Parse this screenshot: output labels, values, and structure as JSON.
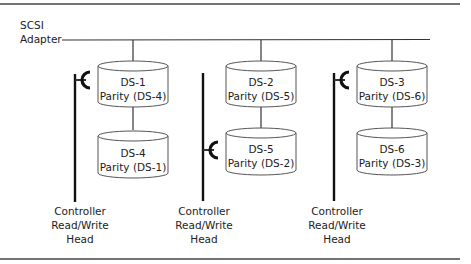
{
  "adapter": {
    "line1": "SCSI",
    "line2": "Adapter"
  },
  "disks": [
    {
      "id": "DS-1",
      "name": "DS-1",
      "parity": "Parity (DS-4)"
    },
    {
      "id": "DS-4",
      "name": "DS-4",
      "parity": "Parity (DS-1)"
    },
    {
      "id": "DS-2",
      "name": "DS-2",
      "parity": "Parity (DS-5)"
    },
    {
      "id": "DS-5",
      "name": "DS-5",
      "parity": "Parity (DS-2)"
    },
    {
      "id": "DS-3",
      "name": "DS-3",
      "parity": "Parity (DS-6)"
    },
    {
      "id": "DS-6",
      "name": "DS-6",
      "parity": "Parity (DS-3)"
    }
  ],
  "heads": [
    {
      "line1": "Controller",
      "line2": "Read/Write",
      "line3": "Head"
    },
    {
      "line1": "Controller",
      "line2": "Read/Write",
      "line3": "Head"
    },
    {
      "line1": "Controller",
      "line2": "Read/Write",
      "line3": "Head"
    }
  ]
}
